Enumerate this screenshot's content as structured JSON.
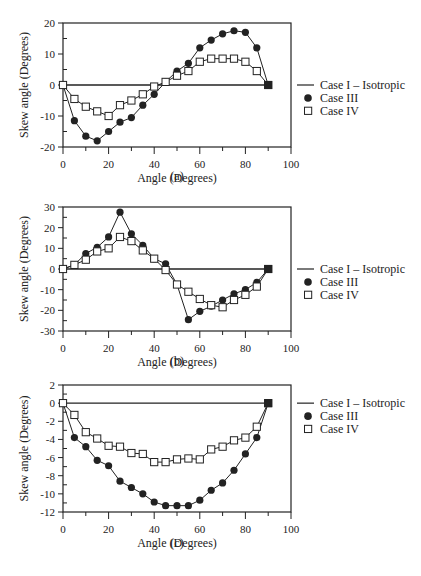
{
  "figure": {
    "legend": [
      {
        "key": "case1",
        "label": "Case I – Isotropic",
        "marker": "line"
      },
      {
        "key": "case3",
        "label": "Case III",
        "marker": "filled-circle"
      },
      {
        "key": "case4",
        "label": "Case IV",
        "marker": "open-square"
      }
    ],
    "colors": {
      "ink": "#222222",
      "background": "#ffffff"
    }
  },
  "chart_data": [
    {
      "type": "line",
      "panel": "(a)",
      "caption": "(a)",
      "xlabel": "Angle (Degrees)",
      "ylabel": "Skew angle (Degrees)",
      "xlim": [
        0,
        100
      ],
      "ylim": [
        -20,
        20
      ],
      "xticks": [
        0,
        20,
        40,
        60,
        80,
        100
      ],
      "yticks": [
        20,
        10,
        0,
        -10,
        -20
      ],
      "grid": false,
      "legend_position": "right",
      "x": [
        0,
        5,
        10,
        15,
        20,
        25,
        30,
        35,
        40,
        45,
        50,
        55,
        60,
        65,
        70,
        75,
        80,
        85,
        90
      ],
      "series": [
        {
          "name": "Case I – Isotropic",
          "values": [
            0,
            0,
            0,
            0,
            0,
            0,
            0,
            0,
            0,
            0,
            0,
            0,
            0,
            0,
            0,
            0,
            0,
            0,
            0
          ]
        },
        {
          "name": "Case III",
          "values": [
            0,
            -11.5,
            -16.5,
            -18,
            -15,
            -12,
            -10.5,
            -6.5,
            -3,
            1,
            4.5,
            7,
            12,
            14.5,
            16.5,
            17.5,
            17,
            12,
            0
          ]
        },
        {
          "name": "Case IV",
          "values": [
            0,
            -4.5,
            -7,
            -8.5,
            -10,
            -6.5,
            -5,
            -3,
            -0.5,
            1,
            3,
            4.5,
            7.5,
            8.5,
            8.5,
            8.5,
            7.5,
            4.5,
            0
          ]
        }
      ]
    },
    {
      "type": "line",
      "panel": "(b)",
      "caption": "(b)",
      "xlabel": "Angle (Degrees)",
      "ylabel": "Skew angle (Degrees)",
      "xlim": [
        0,
        100
      ],
      "ylim": [
        -30,
        30
      ],
      "xticks": [
        0,
        20,
        40,
        60,
        80,
        100
      ],
      "yticks": [
        30,
        20,
        10,
        0,
        -10,
        -20,
        -30
      ],
      "grid": false,
      "legend_position": "right",
      "x": [
        0,
        5,
        10,
        15,
        20,
        25,
        30,
        35,
        40,
        45,
        50,
        55,
        60,
        65,
        70,
        75,
        80,
        85,
        90
      ],
      "series": [
        {
          "name": "Case I – Isotropic",
          "values": [
            0,
            0,
            0,
            0,
            0,
            0,
            0,
            0,
            0,
            0,
            0,
            0,
            0,
            0,
            0,
            0,
            0,
            0,
            0
          ]
        },
        {
          "name": "Case III",
          "values": [
            0,
            2,
            7.5,
            10.5,
            15.5,
            27.5,
            17,
            11.5,
            5,
            2.5,
            -7.5,
            -24.5,
            -20.5,
            -18,
            -15,
            -12,
            -10,
            -6.5,
            0
          ]
        },
        {
          "name": "Case IV",
          "values": [
            0,
            2,
            4.5,
            8.5,
            10,
            15.5,
            13.5,
            9,
            5,
            -0.5,
            -7.5,
            -11,
            -14.5,
            -17.5,
            -18.5,
            -15,
            -12.5,
            -8.5,
            0
          ]
        }
      ]
    },
    {
      "type": "line",
      "panel": "(c)",
      "caption": "(c)",
      "xlabel": "Angle (Degrees)",
      "ylabel": "Skew angle (Degrees)",
      "xlim": [
        0,
        100
      ],
      "ylim": [
        -12,
        2
      ],
      "xticks": [
        0,
        20,
        40,
        60,
        80,
        100
      ],
      "yticks": [
        2,
        0,
        -2,
        -4,
        -6,
        -8,
        -10,
        -12
      ],
      "grid": false,
      "legend_position": "right",
      "x": [
        0,
        5,
        10,
        15,
        20,
        25,
        30,
        35,
        40,
        45,
        50,
        55,
        60,
        65,
        70,
        75,
        80,
        85,
        90
      ],
      "series": [
        {
          "name": "Case I – Isotropic",
          "values": [
            0,
            0,
            0,
            0,
            0,
            0,
            0,
            0,
            0,
            0,
            0,
            0,
            0,
            0,
            0,
            0,
            0,
            0,
            0
          ]
        },
        {
          "name": "Case III",
          "values": [
            0,
            -3.8,
            -4.8,
            -6.3,
            -6.9,
            -8.6,
            -9.3,
            -10,
            -10.9,
            -11.3,
            -11.3,
            -11.3,
            -10.7,
            -9.6,
            -8.8,
            -7.4,
            -5.6,
            -3.8,
            0
          ]
        },
        {
          "name": "Case IV",
          "values": [
            0,
            -1.3,
            -3.2,
            -3.9,
            -4.7,
            -4.8,
            -5.5,
            -5.6,
            -6.5,
            -6.5,
            -6.2,
            -6.1,
            -6.2,
            -5.1,
            -4.8,
            -4.1,
            -3.8,
            -2.6,
            0
          ]
        }
      ]
    }
  ]
}
